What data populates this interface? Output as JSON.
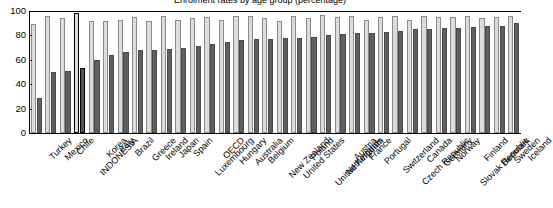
{
  "chart_data": {
    "type": "bar",
    "title": "Enrolment rates by age group (percentage)",
    "xlabel": "",
    "ylabel": "",
    "ylim": [
      0,
      100
    ],
    "yticks": [
      0,
      20,
      40,
      60,
      80,
      100
    ],
    "grid": false,
    "legend": "none",
    "highlight_category": "INDONESIA",
    "categories": [
      "Turkey",
      "Mexico",
      "Chile",
      "INDONESIA",
      "Korea",
      "Italy",
      "Brazil",
      "Greece",
      "Ireland",
      "Japan",
      "Spain",
      "Luxembourg",
      "OECD",
      "Hungary",
      "Australia",
      "Belgium",
      "New Zealand",
      "United States",
      "Poland",
      "United Kingdom",
      "Netherlands",
      "Austria",
      "France",
      "Portugal",
      "Switzerland",
      "Czech Republic",
      "Canada",
      "Germany",
      "Norway",
      "Slovak Republic",
      "Finland",
      "Denmark",
      "Sweden",
      "Iceland"
    ],
    "series": [
      {
        "name": "light",
        "values": [
          89,
          96,
          94,
          98,
          92,
          92,
          93,
          95,
          92,
          96,
          93,
          94,
          95,
          93,
          96,
          96,
          94,
          92,
          96,
          94,
          97,
          95,
          96,
          93,
          95,
          96,
          93,
          96,
          95,
          95,
          96,
          94,
          95,
          96
        ]
      },
      {
        "name": "dark",
        "values": [
          29,
          50,
          51,
          53,
          60,
          64,
          66,
          68,
          68,
          69,
          70,
          71,
          73,
          75,
          76,
          77,
          77,
          78,
          78,
          79,
          80,
          81,
          82,
          82,
          83,
          84,
          85,
          85,
          86,
          86,
          87,
          88,
          88,
          90
        ]
      }
    ]
  }
}
